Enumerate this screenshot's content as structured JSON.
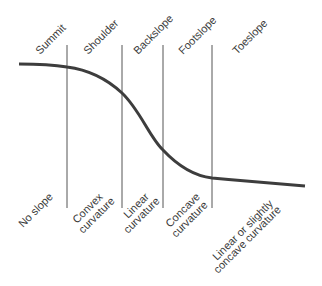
{
  "diagram": {
    "colors": {
      "curve": "#3d3d3d",
      "divider": "#555555",
      "text": "#3a3a3a",
      "background": "#ffffff"
    },
    "positions": [
      {
        "name": "Summit",
        "description": [
          "No slope"
        ]
      },
      {
        "name": "Shoulder",
        "description": [
          "Convex",
          "curvature"
        ]
      },
      {
        "name": "Backslope",
        "description": [
          "Linear",
          "curvature"
        ]
      },
      {
        "name": "Footslope",
        "description": [
          "Concave",
          "curvature"
        ]
      },
      {
        "name": "Toeslope",
        "description": [
          "Linear or slightly",
          "concave curvature"
        ]
      }
    ]
  }
}
